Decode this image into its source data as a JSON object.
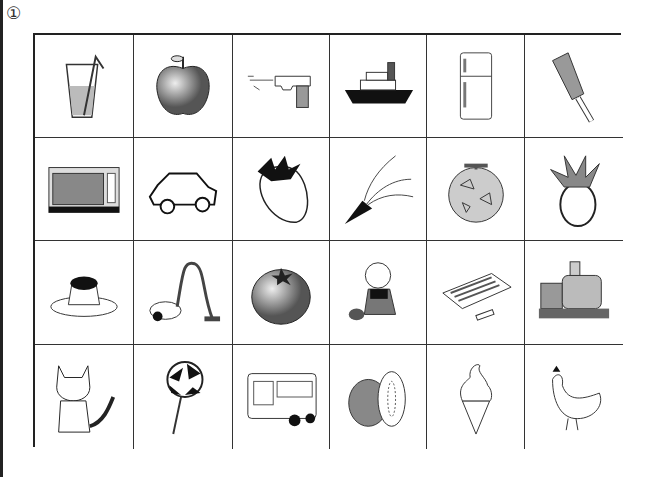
{
  "worksheet": {
    "number_label": "①",
    "grid": {
      "rows": 4,
      "cols": 6,
      "cells": [
        {
          "item": "glass-of-juice"
        },
        {
          "item": "apple"
        },
        {
          "item": "water-gun"
        },
        {
          "item": "ship"
        },
        {
          "item": "refrigerator"
        },
        {
          "item": "kitchen-knife"
        },
        {
          "item": "microwave-oven"
        },
        {
          "item": "car"
        },
        {
          "item": "strawberry"
        },
        {
          "item": "party-popper"
        },
        {
          "item": "melon"
        },
        {
          "item": "pineapple"
        },
        {
          "item": "pudding"
        },
        {
          "item": "vacuum-cleaner"
        },
        {
          "item": "tomato"
        },
        {
          "item": "doll"
        },
        {
          "item": "crayons"
        },
        {
          "item": "train"
        },
        {
          "item": "cat"
        },
        {
          "item": "lollipop"
        },
        {
          "item": "bus"
        },
        {
          "item": "kiwi"
        },
        {
          "item": "ice-cream"
        },
        {
          "item": "chicken"
        }
      ]
    }
  }
}
